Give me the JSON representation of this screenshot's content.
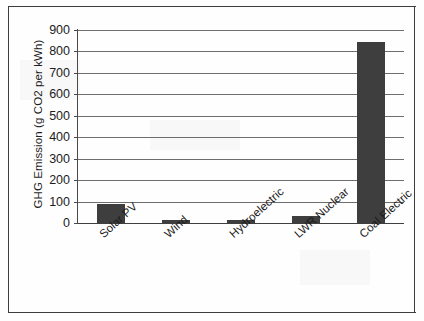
{
  "chart_data": {
    "type": "bar",
    "title": "",
    "xlabel": "",
    "ylabel": "GHG Emission (g CO2 per kWh)",
    "categories": [
      "Solar PV",
      "Wind",
      "Hydroelectric",
      "LWR Nuclear",
      "Coal Electric"
    ],
    "values": [
      90,
      15,
      15,
      35,
      845
    ],
    "ylim": [
      0,
      900
    ],
    "ytick_labels": [
      "900",
      "800",
      "700",
      "600",
      "500",
      "400",
      "300",
      "200",
      "100",
      "0"
    ],
    "ytick_values": [
      900,
      800,
      700,
      600,
      500,
      400,
      300,
      200,
      100,
      0
    ],
    "grid": true,
    "legend": false,
    "bar_color": "#3e3e3e",
    "axis_color": "#494949",
    "gridline_color": "#6e6e6e",
    "background_color": "#ffffff"
  },
  "figure": {
    "frame_color": "#3d3d3d",
    "border_top": "rule",
    "border_bottom": "rule",
    "border_left": "rule",
    "border_right": "rule"
  }
}
